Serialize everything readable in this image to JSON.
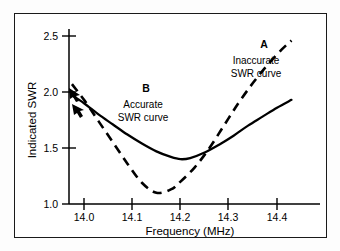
{
  "chart_data": {
    "type": "line",
    "title": "",
    "xlabel": "Frequency (MHz)",
    "ylabel": "Indicated SWR",
    "xlim": [
      13.97,
      14.44
    ],
    "ylim": [
      1.0,
      2.6
    ],
    "xticks": [
      "14.0",
      "14.1",
      "14.2",
      "14.3",
      "14.4"
    ],
    "xtick_values": [
      14.0,
      14.1,
      14.2,
      14.3,
      14.4
    ],
    "yticks": [
      "1.0",
      "1.5",
      "2.0",
      "2.5"
    ],
    "ytick_values": [
      1.0,
      1.5,
      2.0,
      2.5
    ],
    "grid": false,
    "legend_position": "inline-annotations",
    "series": [
      {
        "name": "Accurate SWR curve",
        "label": "B",
        "style": "solid",
        "color": "#000000",
        "x": [
          13.975,
          14.0,
          14.03,
          14.06,
          14.09,
          14.12,
          14.15,
          14.18,
          14.2,
          14.22,
          14.25,
          14.28,
          14.31,
          14.34,
          14.37,
          14.4,
          14.43
        ],
        "y": [
          1.97,
          1.9,
          1.8,
          1.71,
          1.62,
          1.54,
          1.47,
          1.42,
          1.4,
          1.41,
          1.46,
          1.53,
          1.61,
          1.7,
          1.78,
          1.86,
          1.93
        ]
      },
      {
        "name": "Inaccurate SWR curve",
        "label": "A",
        "style": "dashed",
        "color": "#000000",
        "x": [
          13.975,
          14.0,
          14.03,
          14.06,
          14.09,
          14.12,
          14.15,
          14.18,
          14.2,
          14.23,
          14.26,
          14.29,
          14.32,
          14.35,
          14.38,
          14.41,
          14.43
        ],
        "y": [
          2.07,
          1.93,
          1.74,
          1.55,
          1.36,
          1.19,
          1.1,
          1.13,
          1.2,
          1.33,
          1.5,
          1.7,
          1.9,
          2.08,
          2.24,
          2.38,
          2.46
        ]
      }
    ],
    "annotations": [
      {
        "id": "annotation-a",
        "letter": "A",
        "lines": [
          "Inaccurate",
          "SWR curve"
        ],
        "refers_to": "Inaccurate SWR curve"
      },
      {
        "id": "annotation-b",
        "letter": "B",
        "lines": [
          "Accurate",
          "SWR curve"
        ],
        "refers_to": "Accurate SWR curve"
      }
    ]
  }
}
